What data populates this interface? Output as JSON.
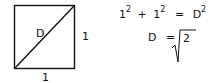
{
  "diagram": {
    "square": {
      "side_bottom_label": "1",
      "side_right_label": "1",
      "diagonal_label": "D"
    },
    "equations": {
      "line1": {
        "a": "1",
        "a_exp": "2",
        "plus": "+",
        "b": "1",
        "b_exp": "2",
        "eq": "=",
        "c": "D",
        "c_exp": "2"
      },
      "line2": {
        "lhs": "D",
        "eq": "=",
        "radicand": "2"
      }
    },
    "colors": {
      "stroke": "#111111",
      "background": "#ffffff"
    }
  }
}
